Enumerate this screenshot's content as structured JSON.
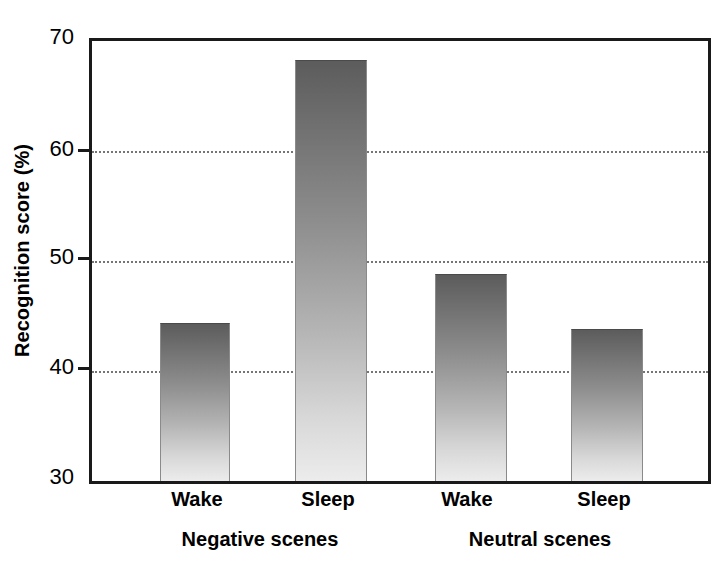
{
  "chart_data": {
    "type": "bar",
    "title": "",
    "xlabel": "",
    "ylabel": "Recognition score (%)",
    "ylim": [
      30,
      70
    ],
    "yticks": [
      30,
      40,
      50,
      60,
      70
    ],
    "ytick_labels": [
      "30",
      "40",
      "50",
      "60",
      "70"
    ],
    "grid": true,
    "legend": "none",
    "categories": [
      "Wake",
      "Sleep",
      "Wake",
      "Sleep"
    ],
    "groups": [
      {
        "label": "Negative scenes",
        "categories": [
          "Wake",
          "Sleep"
        ],
        "values": [
          44.3,
          68.2
        ]
      },
      {
        "label": "Neutral scenes",
        "categories": [
          "Wake",
          "Sleep"
        ],
        "values": [
          48.7,
          43.7
        ]
      }
    ],
    "values": [
      44.3,
      68.2,
      48.7,
      43.7
    ],
    "bar_style": "vertical-gradient-gray",
    "colors": {
      "bar_top": "#5c5c5c",
      "bar_bottom": "#ececec",
      "axis": "#1a1a1a",
      "gridline": "#6e6e6e",
      "text": "#000000",
      "background": "#ffffff"
    }
  },
  "axis": {
    "y_title": "Recognition score (%)",
    "ticks": [
      {
        "value": "70"
      },
      {
        "value": "60"
      },
      {
        "value": "50"
      },
      {
        "value": "40"
      },
      {
        "value": "30"
      }
    ]
  },
  "bars": [
    {
      "label": "Wake",
      "group": "Negative scenes",
      "value": 44.3
    },
    {
      "label": "Sleep",
      "group": "Negative scenes",
      "value": 68.2
    },
    {
      "label": "Wake",
      "group": "Neutral scenes",
      "value": 48.7
    },
    {
      "label": "Sleep",
      "group": "Neutral scenes",
      "value": 43.7
    }
  ],
  "x_labels": [
    {
      "text": "Wake"
    },
    {
      "text": "Sleep"
    },
    {
      "text": "Wake"
    },
    {
      "text": "Sleep"
    }
  ],
  "group_labels": [
    {
      "text": "Negative scenes"
    },
    {
      "text": "Neutral scenes"
    }
  ]
}
